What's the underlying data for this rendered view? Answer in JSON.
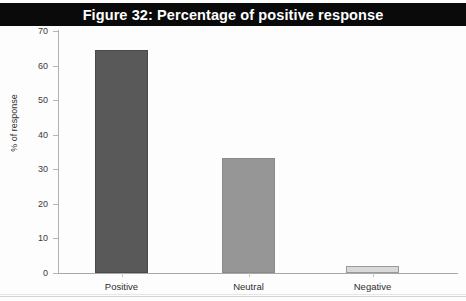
{
  "figure": {
    "title": "Figure 32: Percentage of positive response",
    "title_bar_color": "#0a0a0a",
    "title_text_color": "#ffffff",
    "background_color": "#ffffff"
  },
  "chart_data": {
    "type": "bar",
    "title": "Figure 32: Percentage of positive response",
    "categories": [
      "Positive",
      "Neutral",
      "Negative"
    ],
    "values": [
      64.4,
      33.3,
      2.0
    ],
    "xlabel": "",
    "ylabel": "% of response",
    "ylim": [
      0,
      70
    ],
    "ytick_values": [
      0,
      10,
      20,
      30,
      40,
      50,
      60,
      70
    ],
    "ytick_labels": [
      "0",
      "10",
      "20",
      "30",
      "40",
      "50",
      "60",
      "70"
    ],
    "grid": false,
    "legend": false,
    "bar_colors": [
      "#595959",
      "#969696",
      "#d9d9d9"
    ],
    "bar_edge_colors": [
      "#4a4a4a",
      "#8a8a8a",
      "#9a9a9a"
    ]
  },
  "axes": {
    "y_title": "% of response"
  }
}
